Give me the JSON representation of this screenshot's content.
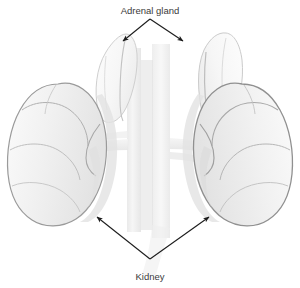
{
  "figure": {
    "background_color": "#ffffff",
    "style": "grayscale line drawing"
  },
  "labels": {
    "adrenal_gland": "Adrenal gland",
    "kidney": "Kidney"
  },
  "colors": {
    "background": "#ffffff",
    "organ_fill": "#f2f2f2",
    "organ_fill_light": "#f8f8f8",
    "organ_outline": "#9a9a9a",
    "organ_outline_soft": "#b4b4b4",
    "adrenal_fill": "#fafafa",
    "adrenal_outline": "#c8c8c8",
    "vessel_fill": "#ededed",
    "vessel_outline": "#dcdcdc",
    "shadow": "#e4e4e4",
    "arrow": "#1c1c1c",
    "label_text": "#3a3a3a"
  },
  "annotations": [
    {
      "id": "adrenal-gland",
      "label": "Adrenal gland",
      "label_x": 150,
      "label_y": 14,
      "leader_origin_x": 150,
      "leader_origin_y": 19,
      "targets": [
        {
          "x": 122,
          "y": 42,
          "side": "left"
        },
        {
          "x": 184,
          "y": 42,
          "side": "right"
        }
      ]
    },
    {
      "id": "kidney",
      "label": "Kidney",
      "label_x": 150,
      "label_y": 277,
      "leader_origin_x": 150,
      "leader_origin_y": 259,
      "targets": [
        {
          "x": 96,
          "y": 216,
          "side": "left"
        },
        {
          "x": 210,
          "y": 216,
          "side": "right"
        }
      ]
    }
  ],
  "structures": [
    {
      "id": "left-kidney",
      "name": "Left kidney",
      "side": "left"
    },
    {
      "id": "right-kidney",
      "name": "Right kidney",
      "side": "right"
    },
    {
      "id": "left-adrenal-gland",
      "name": "Left adrenal gland",
      "side": "left"
    },
    {
      "id": "right-adrenal-gland",
      "name": "Right adrenal gland",
      "side": "right"
    },
    {
      "id": "aorta",
      "name": "Abdominal aorta",
      "side": "center"
    },
    {
      "id": "inferior-vena-cava",
      "name": "Inferior vena cava",
      "side": "center"
    },
    {
      "id": "left-renal-vessels",
      "name": "Left renal vessels",
      "side": "left"
    },
    {
      "id": "right-renal-vessels",
      "name": "Right renal vessels",
      "side": "right"
    }
  ]
}
